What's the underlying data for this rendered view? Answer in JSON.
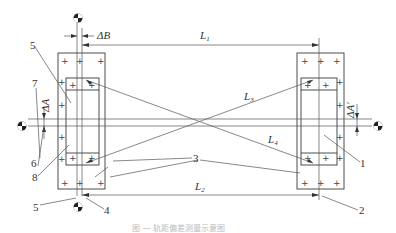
{
  "figure": {
    "caption": "图 — 轨距偏差测量示意图",
    "dimensions": {
      "L1": "L1",
      "L2": "L2",
      "L3": "L3",
      "L4": "L4",
      "dB": "ΔB",
      "dA": "ΔA",
      "dA_prime": "ΔA′"
    },
    "part_labels": [
      "1",
      "2",
      "3",
      "4",
      "5",
      "5",
      "6",
      "7",
      "8"
    ],
    "labels": {
      "n1": "1",
      "n2": "2",
      "n3": "3",
      "n4": "4",
      "n5_top": "5",
      "n5_bottom": "5",
      "n6": "6",
      "n7": "7",
      "n8": "8"
    },
    "center_marks": [
      "target-top",
      "target-bottom",
      "target-left",
      "target-right"
    ],
    "plus": "+"
  }
}
